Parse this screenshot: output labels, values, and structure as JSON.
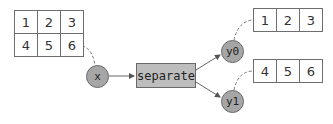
{
  "diagram": {
    "input_table": {
      "rows": [
        [
          "1",
          "2",
          "3"
        ],
        [
          "4",
          "5",
          "6"
        ]
      ]
    },
    "input_node": {
      "label": "x"
    },
    "function_node": {
      "label": "separate"
    },
    "output_nodes": [
      {
        "label": "y0",
        "table": {
          "rows": [
            [
              "1",
              "2",
              "3"
            ]
          ]
        }
      },
      {
        "label": "y1",
        "table": {
          "rows": [
            [
              "4",
              "5",
              "6"
            ]
          ]
        }
      }
    ],
    "colors": {
      "node_fill": "#a6a6a6",
      "function_fill": "#bdbdbd",
      "border": "#6a6a6a",
      "edge": "#666666"
    }
  }
}
